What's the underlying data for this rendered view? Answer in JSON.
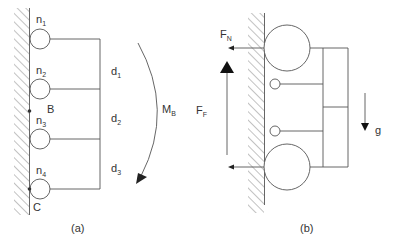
{
  "figure": {
    "panels": [
      {
        "id": "a",
        "caption": "(a)",
        "nodes": [
          {
            "label": "n",
            "sub": "1"
          },
          {
            "label": "n",
            "sub": "2"
          },
          {
            "label": "n",
            "sub": "3"
          },
          {
            "label": "n",
            "sub": "4"
          }
        ],
        "distances": [
          {
            "label": "d",
            "sub": "1"
          },
          {
            "label": "d",
            "sub": "2"
          },
          {
            "label": "d",
            "sub": "3"
          }
        ],
        "points": [
          {
            "label": "B"
          },
          {
            "label": "C"
          }
        ],
        "moment": {
          "label": "M",
          "sub": "B"
        }
      },
      {
        "id": "b",
        "caption": "(b)",
        "forces": [
          {
            "label": "F",
            "sub": "N"
          },
          {
            "label": "F",
            "sub": "F"
          }
        ],
        "gravity": {
          "label": "g"
        }
      }
    ],
    "colors": {
      "line": "#555555",
      "text": "#333333",
      "background": "#ffffff"
    }
  }
}
